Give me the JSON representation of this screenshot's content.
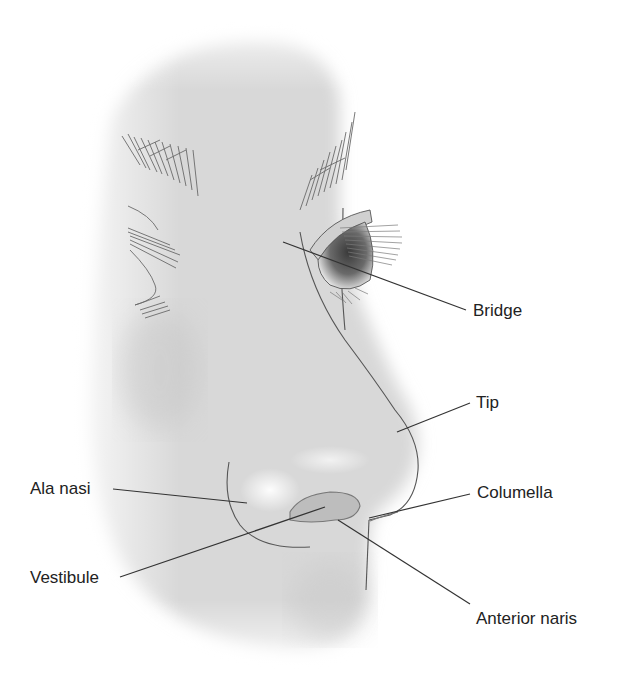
{
  "figure": {
    "colors": {
      "background": "#ffffff",
      "skin": "#d9d9d9",
      "line": "#555555",
      "leader": "#333333",
      "text": "#222222"
    },
    "labels": [
      {
        "id": "bridge",
        "text": "Bridge",
        "x": 473,
        "y": 302,
        "point": [
          283,
          242
        ],
        "anchor": [
          466,
          310
        ]
      },
      {
        "id": "tip",
        "text": "Tip",
        "x": 476,
        "y": 394,
        "point": [
          397,
          432
        ],
        "anchor": [
          470,
          403
        ]
      },
      {
        "id": "columella",
        "text": "Columella",
        "x": 477,
        "y": 484,
        "point": [
          369,
          518
        ],
        "anchor": [
          470,
          494
        ]
      },
      {
        "id": "ala-nasi",
        "text": "Ala nasi",
        "x": 30,
        "y": 480,
        "point": [
          247,
          503
        ],
        "anchor": [
          113,
          489
        ]
      },
      {
        "id": "vestibule",
        "text": "Vestibule",
        "x": 30,
        "y": 569,
        "point": [
          325,
          507
        ],
        "anchor": [
          120,
          577
        ]
      },
      {
        "id": "anterior-naris",
        "text": "Anterior naris",
        "x": 476,
        "y": 618,
        "point": [
          338,
          520
        ],
        "anchor": [
          470,
          604
        ]
      }
    ]
  }
}
